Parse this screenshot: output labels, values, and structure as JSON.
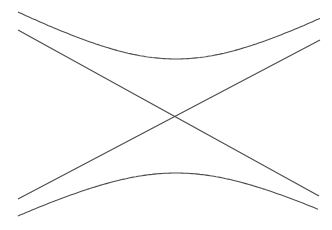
{
  "diagram": {
    "title": "",
    "stroke_color": "#4a4a4a",
    "background": "#ffffff",
    "center": [
      176,
      116
    ],
    "asymptotes": [
      {
        "name": "asymptote-descending",
        "from": [
          18,
          30
        ],
        "to": [
          319,
          196
        ]
      },
      {
        "name": "asymptote-ascending",
        "from": [
          18,
          199
        ],
        "to": [
          320,
          40
        ]
      }
    ],
    "branches": [
      {
        "name": "upper-branch",
        "start": [
          18,
          12
        ],
        "vertex": [
          175,
          59
        ],
        "end": [
          320,
          21
        ]
      },
      {
        "name": "lower-branch",
        "start": [
          18,
          216
        ],
        "vertex": [
          175,
          173
        ],
        "end": [
          318,
          213
        ]
      }
    ]
  }
}
